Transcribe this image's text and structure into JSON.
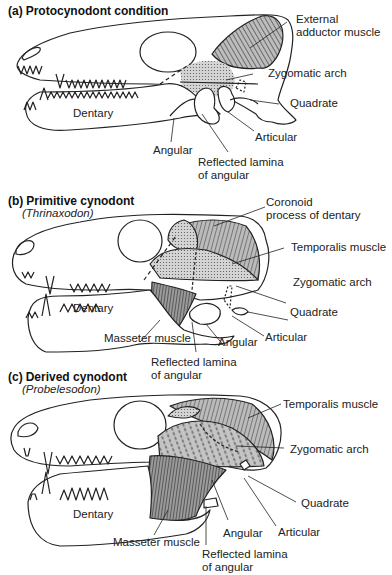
{
  "panels": [
    {
      "id": "a",
      "letter": "(a)",
      "title": "Protocynodont condition",
      "subtitle": "",
      "labels": {
        "external_adductor": [
          "External",
          "adductor muscle"
        ],
        "zygomatic_arch": "Zygomatic arch",
        "quadrate": "Quadrate",
        "dentary": "Dentary",
        "articular": "Articular",
        "angular": "Angular",
        "reflected_lamina": [
          "Reflected lamina",
          "of angular"
        ]
      }
    },
    {
      "id": "b",
      "letter": "(b)",
      "title": "Primitive cynodont",
      "subtitle": "(Thrinaxodon)",
      "labels": {
        "coronoid": [
          "Coronoid",
          "process of dentary"
        ],
        "temporalis": "Temporalis muscle",
        "zygomatic_arch": "Zygomatic arch",
        "quadrate": "Quadrate",
        "dentary": "Dentary",
        "articular": "Articular",
        "masseter": "Masseter muscle",
        "angular": "Angular",
        "reflected_lamina": [
          "Reflected lamina",
          "of angular"
        ]
      }
    },
    {
      "id": "c",
      "letter": "(c)",
      "title": "Derived cynodont",
      "subtitle": "(Probelesodon)",
      "labels": {
        "temporalis": "Temporalis muscle",
        "zygomatic_arch": "Zygomatic arch",
        "quadrate": "Quadrate",
        "dentary": "Dentary",
        "masseter": "Masseter muscle",
        "angular": "Angular",
        "articular": "Articular",
        "reflected_lamina": [
          "Reflected lamina",
          "of angular"
        ]
      }
    }
  ],
  "colors": {
    "line": "#222222",
    "muscle_fill": "#bdbdbd",
    "stipple": "#999999",
    "background": "#ffffff"
  }
}
